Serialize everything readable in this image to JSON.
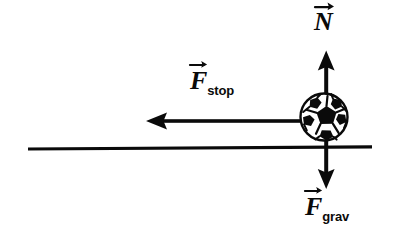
{
  "figure": {
    "type": "free-body-diagram",
    "background_color": "#ffffff",
    "ink_color": "#0a0a0a",
    "width": 396,
    "height": 238
  },
  "object": {
    "name": "soccer-ball",
    "center_x": 324,
    "center_y": 117,
    "radius": 24,
    "ball_white": "#ffffff",
    "ball_black": "#0a0a0a"
  },
  "ground": {
    "name": "ground-line",
    "x_start": 28,
    "x_end": 372,
    "y": 146,
    "thickness": 5
  },
  "forces": [
    {
      "id": "normal",
      "label_base": "N",
      "label_sub": "",
      "direction": "up",
      "arrow_x": 326,
      "arrow_tail_y": 117,
      "arrow_tip_y": 51,
      "label_x": 314,
      "label_y": 9
    },
    {
      "id": "stopping",
      "label_base": "F",
      "label_sub": "stop",
      "direction": "left",
      "arrow_y": 121,
      "arrow_tail_x": 305,
      "arrow_tip_x": 146,
      "label_x": 190,
      "label_y": 68
    },
    {
      "id": "gravity",
      "label_base": "F",
      "label_sub": "grav",
      "direction": "down",
      "arrow_x": 326,
      "arrow_tail_y": 146,
      "arrow_tip_y": 188,
      "label_x": 305,
      "label_y": 194
    }
  ],
  "labels": {
    "normal": {
      "base": "N",
      "sub": ""
    },
    "stop": {
      "base": "F",
      "sub": "stop"
    },
    "grav": {
      "base": "F",
      "sub": "grav"
    }
  }
}
